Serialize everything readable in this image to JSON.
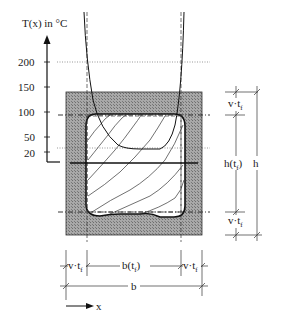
{
  "figure": {
    "axis_title": "T(x) in °C",
    "y_ticks": [
      {
        "label": "200",
        "y": 62
      },
      {
        "label": "150",
        "y": 87
      },
      {
        "label": "100",
        "y": 112
      },
      {
        "label": "50",
        "y": 137
      },
      {
        "label": "20",
        "y": 153
      }
    ],
    "dimensions": {
      "top_char_depth": "v·t",
      "bottom_char_depth": "v·t",
      "residual_height": "h(t",
      "full_height": "h",
      "left_char_width": "v·t",
      "right_char_width": "v·t",
      "residual_width": "b(t",
      "full_width": "b",
      "subscript": "f",
      "subscript_close": ")"
    },
    "x_axis_label": "x",
    "colors": {
      "char_layer": "#9a9a9a",
      "residual": "#ffffff",
      "line": "#1a1a1a"
    }
  }
}
